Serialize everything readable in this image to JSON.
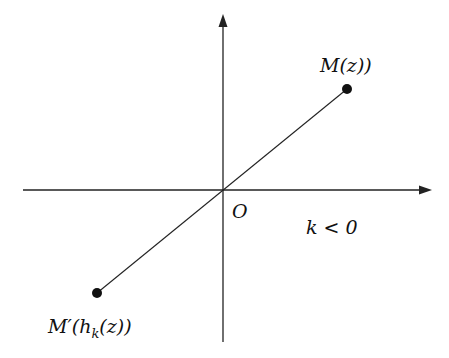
{
  "diagram": {
    "title": "",
    "origin_label": "O",
    "point_m_label": "M(z))",
    "point_m_prime_label": "M′(h",
    "point_m_prime_sub": "k",
    "point_m_prime_tail": "(z))",
    "condition_label": "k < 0",
    "colors": {
      "line": "#222222",
      "point": "#111111",
      "background": "#ffffff"
    }
  }
}
